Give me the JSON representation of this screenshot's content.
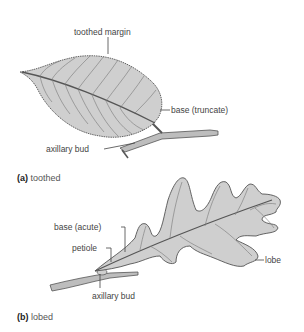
{
  "figure": {
    "panel_a": {
      "caption_letter": "(a)",
      "caption_text": "toothed",
      "labels": {
        "toothed_margin": "toothed margin",
        "base": "base (truncate)",
        "axillary_bud": "axillary bud"
      }
    },
    "panel_b": {
      "caption_letter": "(b)",
      "caption_text": "lobed",
      "labels": {
        "base": "base (acute)",
        "petiole": "petiole",
        "lobe": "lobe",
        "axillary_bud": "axillary bud"
      }
    },
    "colors": {
      "leaf_fill": "#cfcfcf",
      "outline": "#555555",
      "vein": "#666666",
      "label_text": "#444444"
    }
  }
}
